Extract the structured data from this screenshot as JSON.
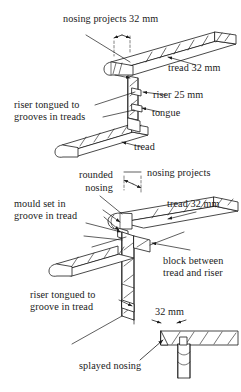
{
  "figure": {
    "ink_color": "#1a1a1a",
    "background_color": "#ffffff",
    "line_color": "#222222",
    "hatch_color": "#444444"
  },
  "upper_detail": {
    "name": "tread-and-riser-tongued-detail",
    "labels": {
      "nosing_projects": "nosing projects 32 mm",
      "tread_32": "tread 32 mm",
      "riser_25": "riser 25 mm",
      "tongue": "tongue",
      "riser_tongued": "riser tongued to\ngrooves in treads",
      "riser_tongued_line1": "riser tongued to",
      "riser_tongued_line2": "grooves in treads",
      "tread": "tread"
    }
  },
  "lower_detail": {
    "name": "rounded-nosing-block-detail",
    "labels": {
      "rounded_nosing_line1": "rounded",
      "rounded_nosing_line2": "nosing",
      "nosing_projects": "nosing projects",
      "mould_set_line1": "mould set in",
      "mould_set_line2": "groove in tread",
      "tread_32": "tread 32 mm",
      "block_line1": "block between",
      "block_line2": "tread and riser",
      "riser_tongued_line1": "riser tongued to",
      "riser_tongued_line2": "groove in tread"
    }
  },
  "splayed_detail": {
    "name": "splayed-nosing-detail",
    "labels": {
      "dimension": "32 mm",
      "caption": "splayed nosing"
    }
  }
}
